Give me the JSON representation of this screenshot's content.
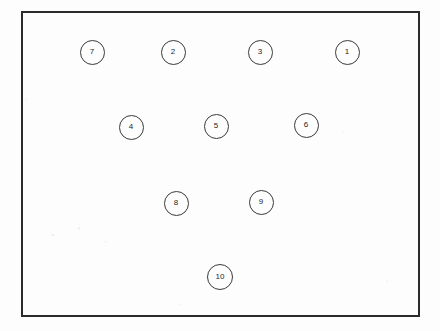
{
  "figure": {
    "kind": "node-diagram",
    "background_color": "#fdfdfd",
    "frame": {
      "name": "figure-border",
      "x": 21,
      "y": 11,
      "width": 399,
      "height": 306,
      "stroke_color": "#2b2b2b",
      "stroke_width": 2
    },
    "node_style": {
      "stroke_color": "#3a3a3a",
      "stroke_width": 1,
      "text_color": "#1d1d1d",
      "font_size": 8
    },
    "nodes": [
      {
        "label": "7",
        "cx": 92,
        "cy": 52,
        "d": 25
      },
      {
        "label": "2",
        "cx": 173,
        "cy": 52,
        "d": 25
      },
      {
        "label": "3",
        "cx": 260,
        "cy": 52,
        "d": 25
      },
      {
        "label": "1",
        "cx": 347,
        "cy": 52,
        "d": 25
      },
      {
        "label": "4",
        "cx": 131,
        "cy": 127,
        "d": 25
      },
      {
        "label": "5",
        "cx": 216,
        "cy": 126,
        "d": 25
      },
      {
        "label": "6",
        "cx": 306,
        "cy": 125,
        "d": 25
      },
      {
        "label": "8",
        "cx": 176,
        "cy": 203,
        "d": 25
      },
      {
        "label": "9",
        "cx": 261,
        "cy": 202,
        "d": 25
      },
      {
        "label": "10",
        "cx": 220,
        "cy": 277,
        "d": 26
      }
    ]
  }
}
